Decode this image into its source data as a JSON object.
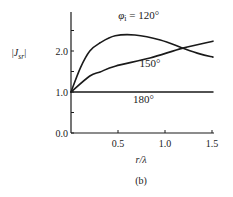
{
  "chart_data": {
    "type": "line",
    "title": "",
    "caption": "(b)",
    "xlabel": "r/λ",
    "ylabel": "|J_sr|",
    "xlim": [
      0,
      1.55
    ],
    "ylim": [
      0,
      2.9
    ],
    "x_ticks": [
      {
        "value": 0.5,
        "label": "0.5"
      },
      {
        "value": 1.0,
        "label": "1.0"
      },
      {
        "value": 1.5,
        "label": "1.5"
      }
    ],
    "y_ticks": [
      {
        "value": 0.0,
        "label": "0.0"
      },
      {
        "value": 0.5,
        "label": ""
      },
      {
        "value": 1.0,
        "label": "1.0"
      },
      {
        "value": 1.5,
        "label": ""
      },
      {
        "value": 2.0,
        "label": "2.0"
      },
      {
        "value": 2.5,
        "label": ""
      }
    ],
    "grid": false,
    "legend": "inline labels",
    "series": [
      {
        "name": "φi = 120°",
        "label": "φi = 120°",
        "x": [
          0,
          0.1,
          0.2,
          0.31,
          0.47,
          0.68,
          0.95,
          1.19,
          1.37,
          1.51
        ],
        "values": [
          1.0,
          1.59,
          2.0,
          2.2,
          2.37,
          2.39,
          2.27,
          2.07,
          1.93,
          1.85
        ]
      },
      {
        "name": "150°",
        "label": "150°",
        "x": [
          0,
          0.2,
          0.31,
          0.47,
          0.84,
          1.19,
          1.51
        ],
        "values": [
          1.0,
          1.39,
          1.49,
          1.63,
          1.83,
          2.07,
          2.24
        ]
      },
      {
        "name": "180°",
        "label": "180°",
        "x": [
          0,
          1.51
        ],
        "values": [
          1.0,
          1.0
        ]
      }
    ],
    "annotations": [
      {
        "text": "φi = 120°",
        "series": "φi = 120°",
        "x": 0.72,
        "y": 2.78
      },
      {
        "text": "150°",
        "series": "150°",
        "x": 0.84,
        "y": 1.6
      },
      {
        "text": "180°",
        "series": "180°",
        "x": 0.77,
        "y": 0.72
      }
    ]
  }
}
